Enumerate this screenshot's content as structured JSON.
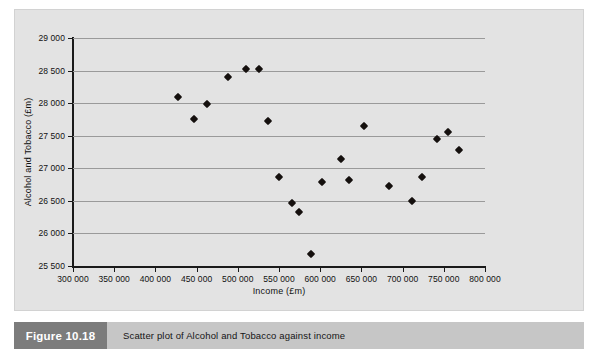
{
  "figure": {
    "tag": "Figure 10.18",
    "caption": "Scatter plot of Alcohol and Tobacco against income",
    "tag_bg": "#7c7c7c",
    "caption_bg": "#c6c6c6",
    "panel_bg": "#e3e3e3"
  },
  "chart_data": {
    "type": "scatter",
    "title": "",
    "xlabel": "Income (£m)",
    "ylabel": "Alcohol and Tobacco (£m)",
    "xlim": [
      300000,
      800000
    ],
    "ylim": [
      25500,
      29000
    ],
    "xticks": [
      300000,
      350000,
      400000,
      450000,
      500000,
      550000,
      600000,
      650000,
      700000,
      750000,
      800000
    ],
    "yticks": [
      25500,
      26000,
      26500,
      27000,
      27500,
      28000,
      28500,
      29000
    ],
    "xtick_labels": [
      "300 000",
      "350 000",
      "400 000",
      "450 000",
      "500 000",
      "550 000",
      "600 000",
      "650 000",
      "700 000",
      "750 000",
      "800 000"
    ],
    "ytick_labels": [
      "25 500",
      "26 000",
      "26 500",
      "27 000",
      "27 500",
      "28 000",
      "28 500",
      "29 000"
    ],
    "grid": "horizontal",
    "legend": "none",
    "marker": "diamond",
    "marker_color": "#15100e",
    "series": [
      {
        "name": "Alcohol and Tobacco vs Income",
        "points": [
          {
            "x": 428000,
            "y": 28090
          },
          {
            "x": 447000,
            "y": 27750
          },
          {
            "x": 463000,
            "y": 27980
          },
          {
            "x": 488000,
            "y": 28400
          },
          {
            "x": 510000,
            "y": 28520
          },
          {
            "x": 526000,
            "y": 28520
          },
          {
            "x": 537000,
            "y": 27720
          },
          {
            "x": 550000,
            "y": 26870
          },
          {
            "x": 566000,
            "y": 26470
          },
          {
            "x": 574000,
            "y": 26330
          },
          {
            "x": 589000,
            "y": 25685
          },
          {
            "x": 602000,
            "y": 26795
          },
          {
            "x": 625000,
            "y": 27135
          },
          {
            "x": 635000,
            "y": 26825
          },
          {
            "x": 653000,
            "y": 27645
          },
          {
            "x": 683000,
            "y": 26730
          },
          {
            "x": 711000,
            "y": 26495
          },
          {
            "x": 723000,
            "y": 26870
          },
          {
            "x": 742000,
            "y": 27455
          },
          {
            "x": 755000,
            "y": 27550
          },
          {
            "x": 768000,
            "y": 27275
          }
        ]
      }
    ]
  }
}
